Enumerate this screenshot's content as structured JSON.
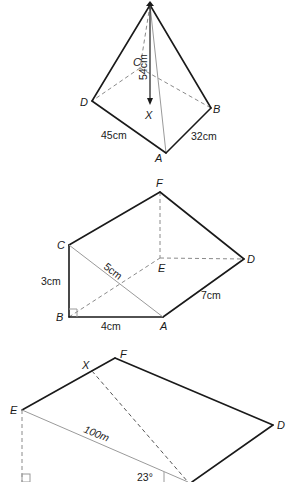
{
  "figures": [
    {
      "id": "pyramid",
      "vertex_labels": {
        "C": "C",
        "D": "D",
        "X": "X",
        "B": "B",
        "A": "A"
      },
      "measurements": {
        "height": "54cm",
        "DA": "45cm",
        "AB": "32cm"
      }
    },
    {
      "id": "triangular-prism",
      "vertex_labels": {
        "F": "F",
        "C": "C",
        "E": "E",
        "D": "D",
        "B": "B",
        "A": "A"
      },
      "measurements": {
        "CA": "5cm",
        "CB": "3cm",
        "BA": "4cm",
        "AD": "7cm"
      }
    },
    {
      "id": "slope-plane",
      "vertex_labels": {
        "X": "X",
        "F": "F",
        "E": "E",
        "D": "D"
      },
      "measurements": {
        "EA": "100m",
        "angle": "23°"
      }
    }
  ]
}
